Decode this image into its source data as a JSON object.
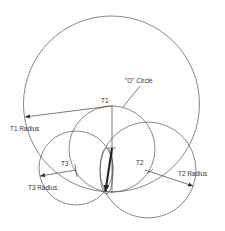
{
  "labels": {
    "o_circle": "\"O\" Circle",
    "t1": "T1",
    "t2": "T2",
    "t3": "T3",
    "t1_radius": "T1 Radius",
    "t2_radius": "T2 Radius",
    "t3_radius": "T3 Radius"
  },
  "circles": [
    {
      "id": "t1-circle",
      "cx": 111.5,
      "cy": 104,
      "r": 88
    },
    {
      "id": "o-circle",
      "cx": 112,
      "cy": 149,
      "r": 43
    },
    {
      "id": "t2-circle",
      "cx": 148,
      "cy": 170,
      "r": 48
    },
    {
      "id": "t3-circle",
      "cx": 76,
      "cy": 168,
      "r": 37
    }
  ],
  "colors": {
    "stroke": "#555555",
    "text": "#333333",
    "arrow": "#222222"
  }
}
